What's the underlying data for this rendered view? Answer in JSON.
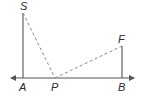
{
  "diagram": {
    "points": {
      "S": {
        "label": "S",
        "x": 23,
        "y": 13
      },
      "A": {
        "label": "A",
        "x": 23,
        "y": 78
      },
      "P": {
        "label": "P",
        "x": 55,
        "y": 78
      },
      "B": {
        "label": "B",
        "x": 122,
        "y": 78
      },
      "F": {
        "label": "F",
        "x": 122,
        "y": 46
      }
    },
    "segments": [
      {
        "from": "S",
        "to": "A",
        "style": "solid"
      },
      {
        "from": "F",
        "to": "B",
        "style": "solid"
      },
      {
        "from": "S",
        "to": "P",
        "style": "dashed"
      },
      {
        "from": "P",
        "to": "F",
        "style": "dashed"
      }
    ],
    "line": {
      "label": "line AB",
      "x1": 10,
      "x2": 135,
      "y": 78,
      "arrows": "both"
    },
    "colors": {
      "stroke": "#555555",
      "dashed": "#888888",
      "text": "#2a2a2a"
    }
  }
}
